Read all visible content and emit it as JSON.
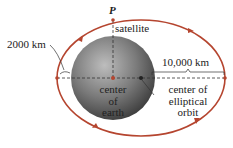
{
  "diagram": {
    "type": "elliptical orbit of satellite around earth",
    "colors": {
      "orbit": "#b5452f",
      "earth_light": "#b0b0b0",
      "earth_dark": "#3a3a3a",
      "dashed_line": "#333333",
      "text": "#222222"
    },
    "labels": {
      "point": "P",
      "satellite": "satellite",
      "altitude": "2000 km",
      "semi_major": "10,000 km",
      "center_earth_1": "center",
      "center_earth_2": "of",
      "center_earth_3": "earth",
      "center_orbit_1": "center of",
      "center_orbit_2": "elliptical",
      "center_orbit_3": "orbit"
    }
  }
}
